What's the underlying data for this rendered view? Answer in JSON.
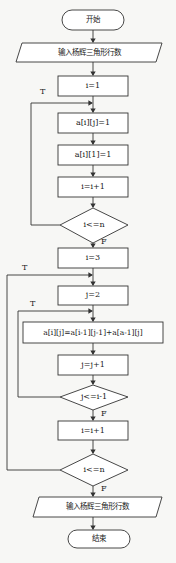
{
  "flowchart": {
    "start": "开始",
    "input": "输入杨辉三角形行数",
    "init_i": "i=1",
    "set_aij": "a[i][j]=1",
    "set_ai1": "a[i][1]=1",
    "inc_i_1": "i=i+1",
    "cond_i_1": "i<=n",
    "init_i3": "i=3",
    "init_j2": "j=2",
    "formula": "a[i][j]=a[i-1][j-1]+a[a-1][j]",
    "inc_j": "j=j+1",
    "cond_j": "j<=i-1",
    "inc_i_2": "i=i+1",
    "cond_i_2": "i<=n",
    "output": "输入杨辉三角形行数",
    "end": "结束",
    "true_label": "T",
    "false_label": "F"
  },
  "colors": {
    "stroke": "#333333",
    "background": "#f7f7f5"
  }
}
